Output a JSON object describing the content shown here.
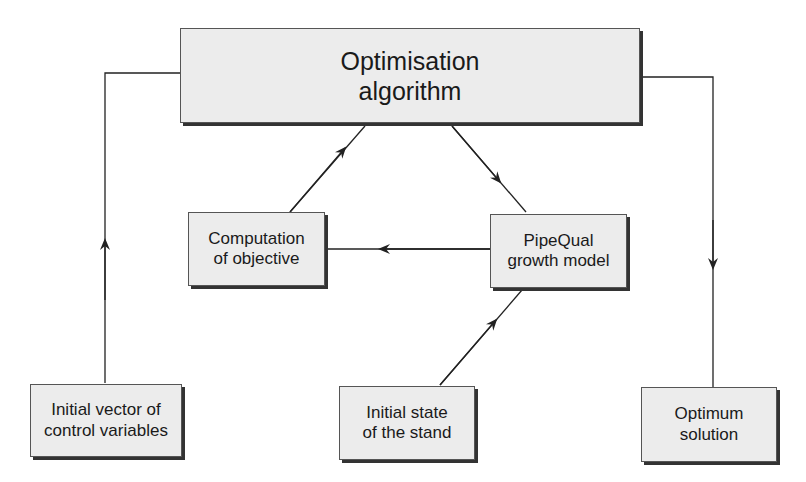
{
  "diagram": {
    "nodes": {
      "optimisation": {
        "label": "Optimisation\nalgorithm"
      },
      "computation": {
        "label": "Computation\nof objective"
      },
      "pipequal": {
        "label": "PipeQual\ngrowth model"
      },
      "initial_vector": {
        "label": "Initial vector of\ncontrol variables"
      },
      "initial_state": {
        "label": "Initial state\nof the stand"
      },
      "optimum": {
        "label": "Optimum\nsolution"
      }
    },
    "edges": [
      {
        "from": "initial_vector",
        "to": "optimisation"
      },
      {
        "from": "optimisation",
        "to": "pipequal"
      },
      {
        "from": "pipequal",
        "to": "computation"
      },
      {
        "from": "computation",
        "to": "optimisation"
      },
      {
        "from": "initial_state",
        "to": "pipequal"
      },
      {
        "from": "optimisation",
        "to": "optimum"
      }
    ],
    "colors": {
      "box_fill": "#ececec",
      "line": "#222222"
    }
  }
}
